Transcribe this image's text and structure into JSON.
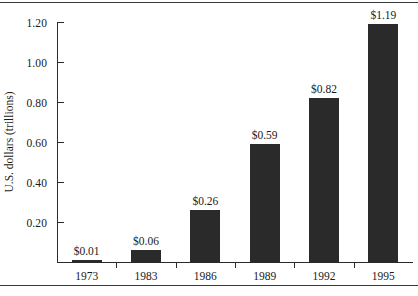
{
  "chart_data": {
    "type": "bar",
    "title": "",
    "subtitle": "",
    "xlabel": "",
    "ylabel": "U.S. dollars (trillions)",
    "categories": [
      "1973",
      "1983",
      "1986",
      "1989",
      "1992",
      "1995"
    ],
    "values": [
      0.01,
      0.06,
      0.26,
      0.59,
      0.82,
      1.19
    ],
    "value_labels": [
      "$0.01",
      "$0.06",
      "$0.26",
      "$0.59",
      "$0.82",
      "$1.19"
    ],
    "ylim": [
      0.0,
      1.2
    ],
    "ytick_values": [
      0.2,
      0.4,
      0.6,
      0.8,
      1.0,
      1.2
    ],
    "ytick_labels": [
      "0.20",
      "0.40",
      "0.60",
      "0.80",
      "1.00",
      "1.20"
    ],
    "grid": false,
    "legend": null,
    "legend_position": "none",
    "bar_color": "#2a2a2a",
    "axis_color": "#2b2b2b",
    "background_color": "#ffffff",
    "text_color": "#1a1a1a"
  }
}
